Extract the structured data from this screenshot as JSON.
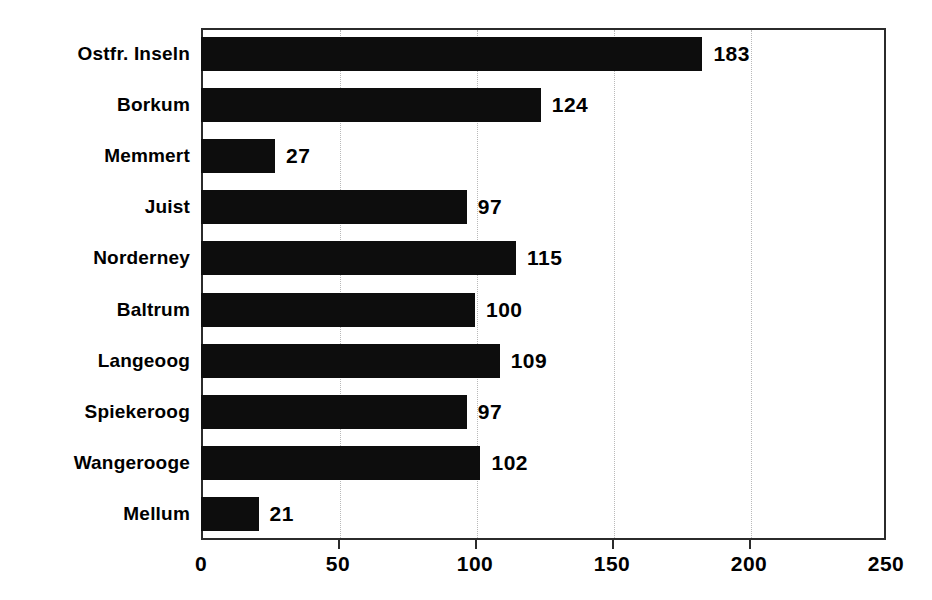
{
  "chart_data": {
    "type": "bar",
    "orientation": "horizontal",
    "title": "",
    "subtitle": "",
    "xlabel": "",
    "ylabel": "",
    "categories": [
      "Ostfr. Inseln",
      "Borkum",
      "Memmert",
      "Juist",
      "Norderney",
      "Baltrum",
      "Langeoog",
      "Spiekeroog",
      "Wangerooge",
      "Mellum"
    ],
    "values": [
      183,
      124,
      27,
      97,
      115,
      100,
      109,
      97,
      102,
      21
    ],
    "value_labels": [
      "183",
      "124",
      "27",
      "97",
      "115",
      "100",
      "109",
      "97",
      "102",
      "21"
    ],
    "xlim": [
      0,
      250
    ],
    "xticks": [
      0,
      50,
      100,
      150,
      200,
      250
    ],
    "xtick_labels": [
      "0",
      "50",
      "100",
      "150",
      "200",
      "250"
    ],
    "grid": true,
    "grid_axis": "x",
    "legend": null,
    "bar_color": "#0d0d0d",
    "frame_color": "#2b2b2b",
    "grid_color": "#b9b9b9",
    "background_color": "#ffffff"
  }
}
